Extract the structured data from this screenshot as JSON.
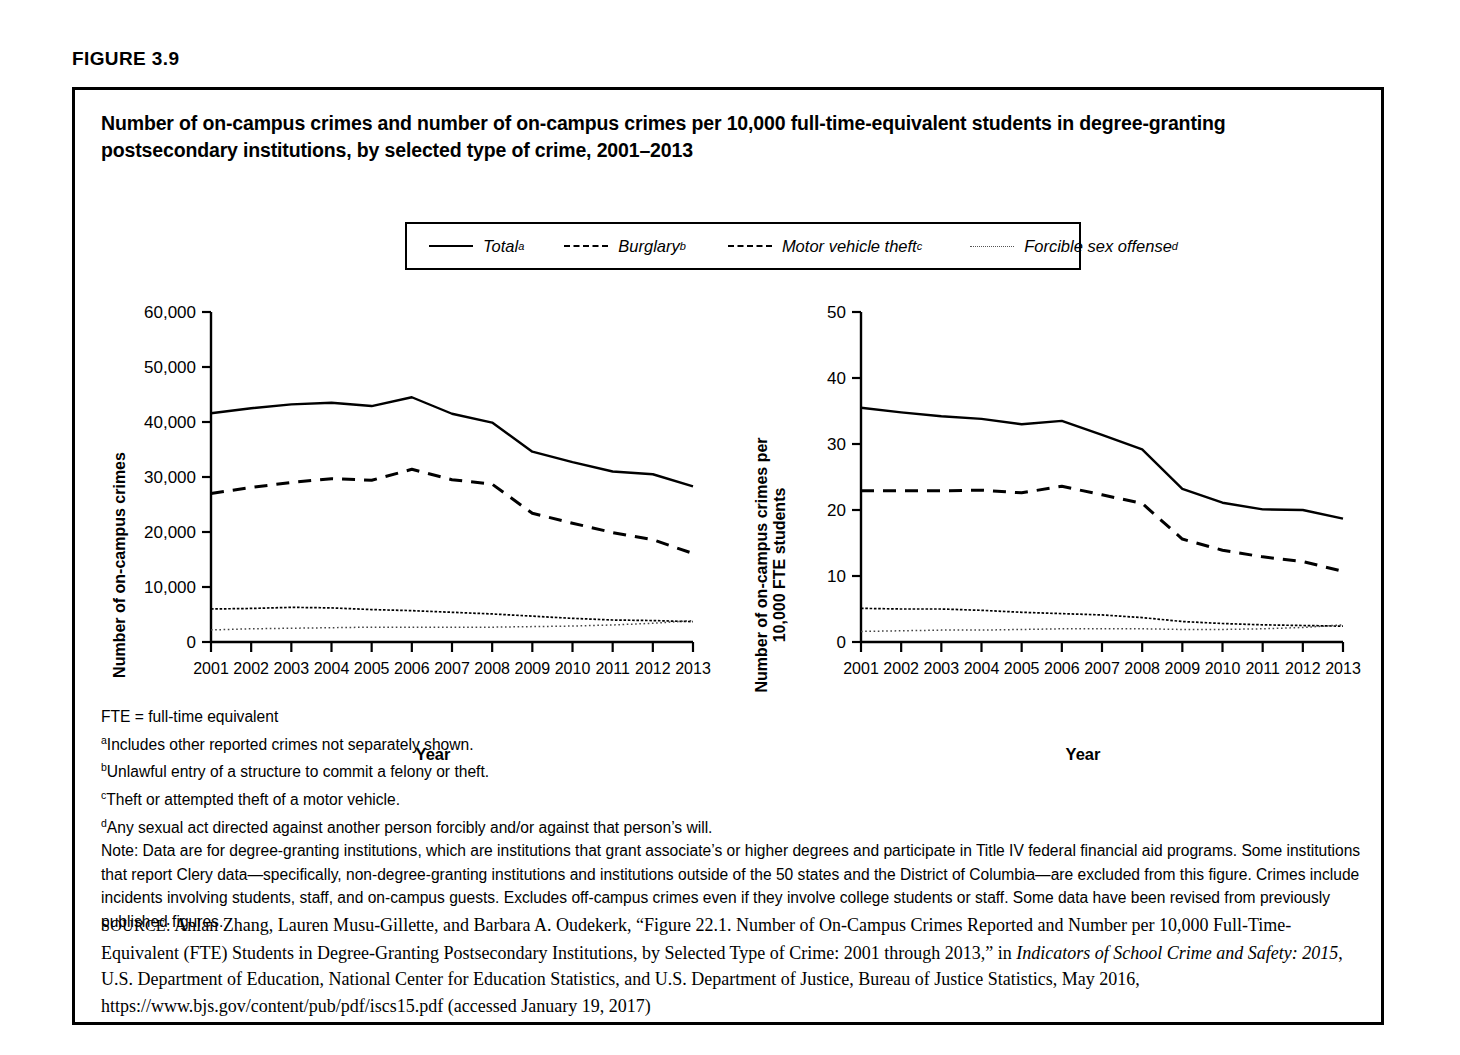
{
  "figure_label": "FIGURE 3.9",
  "title": "Number of on-campus crimes and number of on-campus crimes per 10,000 full-time-equivalent students in degree-granting postsecondary institutions, by selected type of crime, 2001–2013",
  "legend": {
    "items": [
      {
        "label": "Total",
        "sup": "a",
        "style": "solid",
        "name": "legend-total"
      },
      {
        "label": "Burglary",
        "sup": "b",
        "style": "dashed",
        "name": "legend-burglary"
      },
      {
        "label": "Motor vehicle theft",
        "sup": "c",
        "style": "dashdot",
        "name": "legend-motor-vehicle-theft"
      },
      {
        "label": "Forcible sex offense",
        "sup": "d",
        "style": "dotted",
        "name": "legend-forcible-sex-offense"
      }
    ]
  },
  "notes": {
    "fte": "FTE = full-time equivalent",
    "a_sup": "a",
    "a": "Includes other reported crimes not separately shown.",
    "b_sup": "b",
    "b": "Unlawful entry of a structure to commit a felony or theft.",
    "c_sup": "c",
    "c": "Theft or attempted theft of a motor vehicle.",
    "d_sup": "d",
    "d": "Any sexual act directed against another person forcibly and/or against that person’s will.",
    "note": "Note: Data are for degree-granting institutions, which are institutions that grant associate’s or higher degrees and participate in Title IV federal financial aid programs. Some institutions that report Clery data—specifically, non-degree-granting institutions and institutions outside of the 50 states and the District of Columbia—are excluded from this figure. Crimes include incidents involving students, staff, and on-campus guests. Excludes off-campus crimes even if they involve college students or staff. Some data have been revised from previously published figures."
  },
  "source": {
    "label": "SOURCE:",
    "part1": " Anlan Zhang, Lauren Musu-Gillette, and Barbara A. Oudekerk, “Figure 22.1. Number of On-Campus Crimes Reported and Number per 10,000 Full-Time-Equivalent (FTE) Students in Degree-Granting Postsecondary Institutions, by Selected Type of Crime: 2001 through 2013,” in ",
    "italic1": "Indicators of School Crime and Safety: 2015",
    "part2": ", U.S. Department of Education, National Center for Education Statistics, and U.S. Department of Justice, Bureau of Justice Statistics, May 2016, https://www.bjs.gov/content/pub/pdf/iscs15.pdf (accessed January 19, 2017)"
  },
  "chart_data": [
    {
      "id": "left",
      "type": "line",
      "title": "Number of on-campus crimes",
      "xlabel": "Year",
      "ylabel": "Number of on-campus crimes",
      "categories": [
        2001,
        2002,
        2003,
        2004,
        2005,
        2006,
        2007,
        2008,
        2009,
        2010,
        2011,
        2012,
        2013
      ],
      "ylim": [
        0,
        60000
      ],
      "yticks": [
        0,
        10000,
        20000,
        30000,
        40000,
        50000,
        60000
      ],
      "ytick_labels": [
        "0",
        "10,000",
        "20,000",
        "30,000",
        "40,000",
        "50,000",
        "60,000"
      ],
      "xtick_labels": [
        "2001",
        "2002",
        "2003",
        "2004",
        "2005",
        "2006",
        "2007",
        "2008",
        "2009",
        "2010",
        "2011",
        "2012",
        "2013"
      ],
      "grid": false,
      "legend_position": "top",
      "series": [
        {
          "name": "Total",
          "style": "solid",
          "values": [
            41600,
            42500,
            43200,
            43500,
            42900,
            44500,
            41500,
            39900,
            34600,
            32700,
            31000,
            30500,
            28300
          ]
        },
        {
          "name": "Burglary",
          "style": "dashed",
          "values": [
            27000,
            28100,
            29000,
            29700,
            29400,
            31400,
            29500,
            28700,
            23400,
            21600,
            19900,
            18600,
            16100
          ]
        },
        {
          "name": "Motor vehicle theft",
          "style": "dashdot",
          "values": [
            6000,
            6100,
            6300,
            6200,
            5900,
            5700,
            5400,
            5100,
            4700,
            4300,
            4000,
            3900,
            3700
          ]
        },
        {
          "name": "Forcible sex offense",
          "style": "dotted",
          "values": [
            2200,
            2400,
            2500,
            2600,
            2700,
            2700,
            2700,
            2700,
            2800,
            2900,
            3100,
            3400,
            3900
          ]
        }
      ]
    },
    {
      "id": "right",
      "type": "line",
      "title": "Number of on-campus crimes per 10,000 FTE students",
      "xlabel": "Year",
      "ylabel": "Number of on-campus crimes per 10,000 FTE students",
      "categories": [
        2001,
        2002,
        2003,
        2004,
        2005,
        2006,
        2007,
        2008,
        2009,
        2010,
        2011,
        2012,
        2013
      ],
      "ylim": [
        0,
        50
      ],
      "yticks": [
        0,
        10,
        20,
        30,
        40,
        50
      ],
      "ytick_labels": [
        "0",
        "10",
        "20",
        "30",
        "40",
        "50"
      ],
      "xtick_labels": [
        "2001",
        "2002",
        "2003",
        "2004",
        "2005",
        "2006",
        "2007",
        "2008",
        "2009",
        "2010",
        "2011",
        "2012",
        "2013"
      ],
      "grid": false,
      "legend_position": "top",
      "series": [
        {
          "name": "Total",
          "style": "solid",
          "values": [
            35.5,
            34.8,
            34.2,
            33.8,
            33.0,
            33.5,
            31.4,
            29.2,
            23.2,
            21.1,
            20.1,
            20.0,
            18.7
          ]
        },
        {
          "name": "Burglary",
          "style": "dashed",
          "values": [
            22.9,
            22.9,
            22.9,
            23.0,
            22.6,
            23.6,
            22.3,
            21.0,
            15.6,
            13.9,
            12.9,
            12.2,
            10.7
          ]
        },
        {
          "name": "Motor vehicle theft",
          "style": "dashdot",
          "values": [
            5.1,
            5.0,
            5.0,
            4.8,
            4.5,
            4.3,
            4.1,
            3.7,
            3.1,
            2.8,
            2.6,
            2.5,
            2.4
          ]
        },
        {
          "name": "Forcible sex offense",
          "style": "dotted",
          "values": [
            1.6,
            1.7,
            1.8,
            1.8,
            1.9,
            2.0,
            2.0,
            2.0,
            1.9,
            1.9,
            2.0,
            2.2,
            2.6
          ]
        }
      ]
    }
  ]
}
